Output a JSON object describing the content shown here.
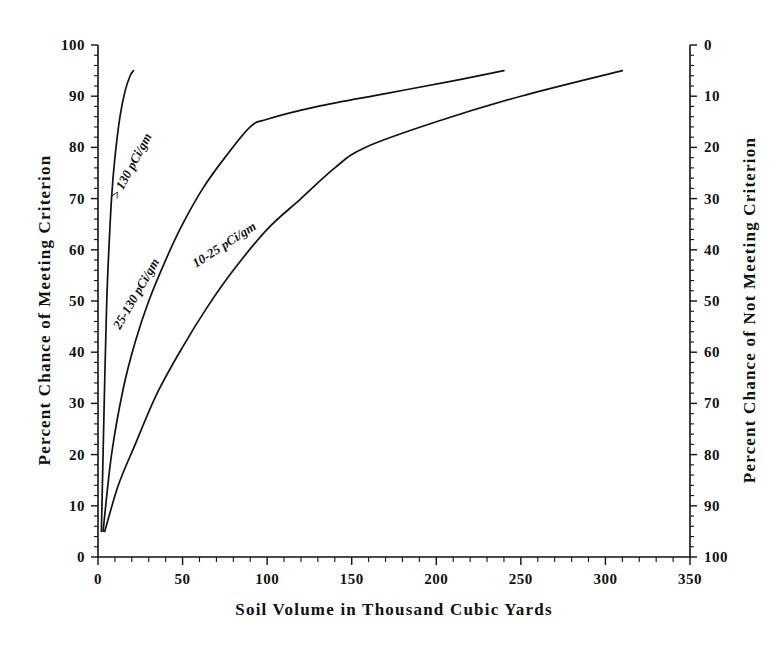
{
  "chart_data": {
    "type": "line",
    "title": "",
    "xlabel": "Soil Volume in Thousand Cubic Yards",
    "ylabel": "Percent Chance of Meeting Criterion",
    "ylabel_right": "Percent Chance of Not Meeting Criterion",
    "xlim": [
      0,
      350
    ],
    "ylim": [
      0,
      100
    ],
    "ylim_right": [
      100,
      0
    ],
    "grid": false,
    "legend": "inline-curve-labels",
    "xticks": [
      0,
      50,
      100,
      150,
      200,
      250,
      300,
      350
    ],
    "xtick_labels": [
      "0",
      "50",
      "100",
      "150",
      "200",
      "250",
      "300",
      "350"
    ],
    "x_minor_tick_interval": 10,
    "yticks": [
      0,
      10,
      20,
      30,
      40,
      50,
      60,
      70,
      80,
      90,
      100
    ],
    "ytick_labels": [
      "0",
      "10",
      "20",
      "30",
      "40",
      "50",
      "60",
      "70",
      "80",
      "90",
      "100"
    ],
    "yticks_right": [
      0,
      10,
      20,
      30,
      40,
      50,
      60,
      70,
      80,
      90,
      100
    ],
    "ytick_labels_right": [
      "0",
      "10",
      "20",
      "30",
      "40",
      "50",
      "60",
      "70",
      "80",
      "90",
      "100"
    ],
    "y_minor_tick_interval": 2,
    "series": [
      {
        "name": "> 130 pCi/gm",
        "label": "> 130 pCi/gm",
        "label_rotation": -62,
        "x": [
          2,
          3,
          4,
          5,
          6,
          8,
          10,
          13,
          16,
          19,
          21
        ],
        "values": [
          5,
          20,
          35,
          48,
          57,
          70,
          78,
          86,
          91,
          94,
          95
        ]
      },
      {
        "name": "25-130 pCi/gm",
        "label": "25-130 pCi/gm",
        "label_rotation": -60,
        "x": [
          3,
          8,
          15,
          22,
          30,
          40,
          50,
          62,
          75,
          90,
          100,
          130,
          170,
          210,
          240
        ],
        "values": [
          5,
          20,
          33,
          42,
          50,
          58,
          65,
          72,
          78,
          84,
          85.5,
          88,
          90.5,
          93,
          95
        ]
      },
      {
        "name": "10-25 pCi/gm",
        "label": "10-25 pCi/gm",
        "label_rotation": -33,
        "x": [
          4,
          12,
          22,
          35,
          50,
          65,
          80,
          100,
          120,
          140,
          158,
          200,
          250,
          310
        ],
        "values": [
          5,
          14,
          22,
          32,
          41,
          49,
          56,
          64,
          70,
          76,
          80,
          85,
          90,
          95
        ]
      }
    ]
  }
}
